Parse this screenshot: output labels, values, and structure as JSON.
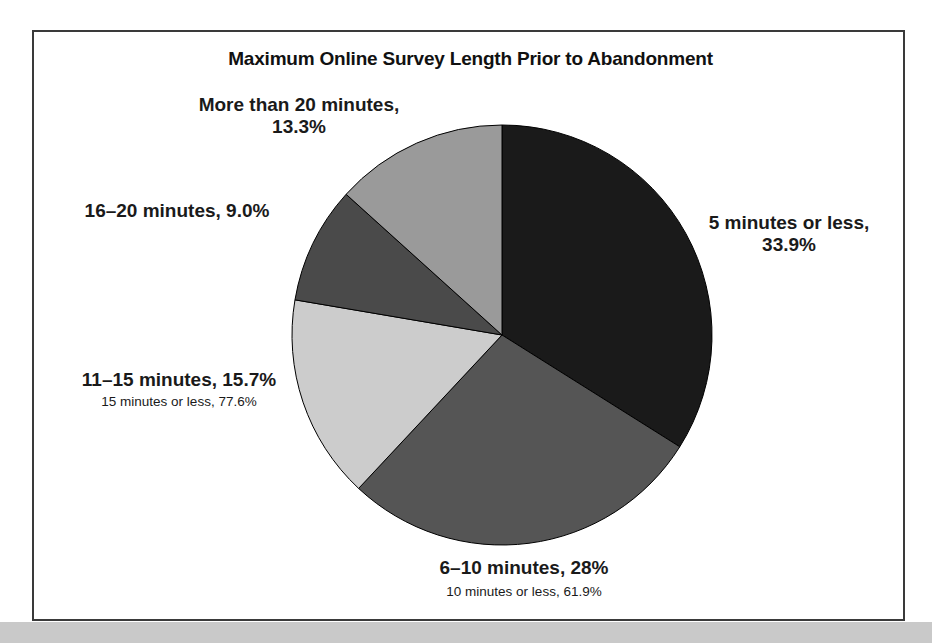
{
  "figure": {
    "title": "Maximum Online Survey Length Prior to Abandonment",
    "background": "#ffffff",
    "frame_color": "#3a3a3a",
    "band_color": "#c9c9c9"
  },
  "chart_data": {
    "type": "pie",
    "title": "Maximum Online Survey Length Prior to Abandonment",
    "xlabel": "",
    "ylabel": "",
    "start_angle_deg": 0,
    "direction": "clockwise",
    "legend": "none",
    "grid": false,
    "categories": [
      "5 minutes or less",
      "6–10 minutes",
      "11–15 minutes",
      "16–20 minutes",
      "More than 20 minutes"
    ],
    "values": [
      33.9,
      28.0,
      15.7,
      9.0,
      13.3
    ],
    "value_unit": "percent",
    "colors": [
      "#1a1a1a",
      "#555555",
      "#cccccc",
      "#4a4a4a",
      "#9a9a9a"
    ],
    "slice_labels": [
      "5 minutes or less,\n33.9%",
      "6–10 minutes, 28%",
      "11–15 minutes, 15.7%",
      "16–20 minutes, 9.0%",
      "More than 20 minutes,\n13.3%"
    ],
    "annotations": [
      {
        "text": "15 minutes or less, 77.6%",
        "value": 77.6,
        "attached_to": "11–15 minutes"
      },
      {
        "text": "10 minutes or less, 61.9%",
        "value": 61.9,
        "attached_to": "6–10 minutes"
      }
    ]
  },
  "labels": {
    "more_than_20": "More than 20 minutes,\n13.3%",
    "sixteen_to_20": "16–20 minutes, 9.0%",
    "eleven_to_15": "11–15 minutes, 15.7%",
    "eleven_to_15_sub": "15 minutes or less, 77.6%",
    "five_or_less": "5 minutes or less,\n33.9%",
    "six_to_10": "6–10 minutes, 28%",
    "six_to_10_sub": "10 minutes or less, 61.9%"
  }
}
